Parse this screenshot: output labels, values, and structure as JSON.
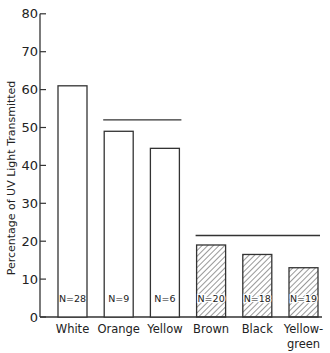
{
  "chart_data": {
    "type": "bar",
    "title": "",
    "xlabel": "",
    "ylabel": "Percentage of UV Light Transmitted",
    "ylim": [
      0,
      80
    ],
    "yticks": [
      0,
      10,
      20,
      30,
      40,
      50,
      60,
      70,
      80
    ],
    "grid": false,
    "legend": null,
    "categories": [
      "White",
      "Orange",
      "Yellow",
      "Brown",
      "Black",
      "Yellow-green"
    ],
    "category_labels_display": [
      [
        "White"
      ],
      [
        "Orange"
      ],
      [
        "Yellow"
      ],
      [
        "Brown"
      ],
      [
        "Black"
      ],
      [
        "Yellow-",
        "green"
      ]
    ],
    "values": [
      61,
      49,
      44.5,
      19,
      16.5,
      13
    ],
    "n_labels": [
      "N=28",
      "N=9",
      "N=6",
      "N=20",
      "N=18",
      "N=19"
    ],
    "fill": [
      "open",
      "open",
      "open",
      "hatched",
      "hatched",
      "hatched"
    ],
    "annotations": [
      {
        "type": "hline",
        "y": 52,
        "from_category": "Orange",
        "to_category": "Yellow",
        "note": "group bracket"
      },
      {
        "type": "hline",
        "y": 21.5,
        "from_category": "Brown",
        "to_category": "Yellow-green",
        "note": "group bracket"
      }
    ]
  }
}
